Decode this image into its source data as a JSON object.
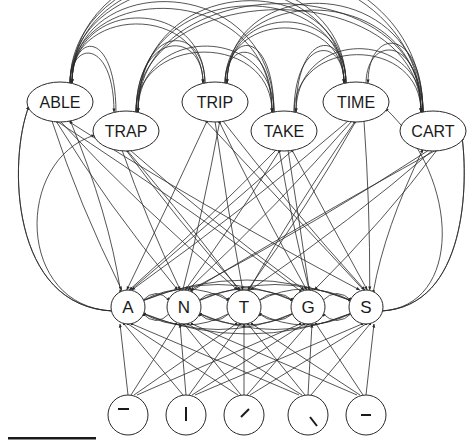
{
  "diagram": {
    "type": "interactive-activation-network",
    "layers": {
      "word": {
        "nodes": [
          {
            "id": "ABLE",
            "label": "ABLE",
            "x": 60,
            "y": 102
          },
          {
            "id": "TRAP",
            "label": "TRAP",
            "x": 126,
            "y": 131
          },
          {
            "id": "TRIP",
            "label": "TRIP",
            "x": 215,
            "y": 102
          },
          {
            "id": "TAKE",
            "label": "TAKE",
            "x": 284,
            "y": 131
          },
          {
            "id": "TIME",
            "label": "TIME",
            "x": 356,
            "y": 102
          },
          {
            "id": "CART",
            "label": "CART",
            "x": 433,
            "y": 131
          }
        ]
      },
      "letter": {
        "nodes": [
          {
            "id": "A",
            "label": "A",
            "x": 128,
            "y": 307
          },
          {
            "id": "N",
            "label": "N",
            "x": 184,
            "y": 307
          },
          {
            "id": "T",
            "label": "T",
            "x": 244,
            "y": 307
          },
          {
            "id": "G",
            "label": "G",
            "x": 308,
            "y": 307
          },
          {
            "id": "S",
            "label": "S",
            "x": 366,
            "y": 307
          }
        ]
      },
      "feature": {
        "nodes": [
          {
            "id": "f1",
            "glyph": "horizontal-bar-top-left",
            "x": 128,
            "y": 415
          },
          {
            "id": "f2",
            "glyph": "vertical-bar",
            "x": 186,
            "y": 415
          },
          {
            "id": "f3",
            "glyph": "diagonal-right",
            "x": 244,
            "y": 415
          },
          {
            "id": "f4",
            "glyph": "diagonal-left-lower",
            "x": 308,
            "y": 415
          },
          {
            "id": "f5",
            "glyph": "horizontal-bar-middle",
            "x": 366,
            "y": 415
          }
        ]
      }
    },
    "colors": {
      "stroke": "#2a2a2a",
      "fill": "#ffffff",
      "text": "#1a1a1a"
    }
  }
}
